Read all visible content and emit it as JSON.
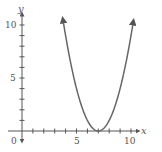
{
  "chart_data": {
    "type": "line",
    "title": "",
    "xlabel": "x",
    "ylabel": "y",
    "function": "y = (x - 7)^2",
    "x": [
      3.76,
      4,
      4.5,
      5,
      5.5,
      6,
      6.5,
      7,
      7.5,
      8,
      8.5,
      9,
      9.5,
      10,
      10.24
    ],
    "values": [
      10.5,
      9,
      6.25,
      4,
      2.25,
      1,
      0.25,
      0,
      0.25,
      1,
      2.25,
      4,
      6.25,
      9,
      10.5
    ],
    "xlim": [
      0,
      11
    ],
    "ylim": [
      0,
      11
    ],
    "x_ticks": [
      0,
      5,
      10
    ],
    "y_ticks": [
      5,
      10
    ],
    "grid": false,
    "legend": null,
    "arrows_on_curve_ends": true,
    "color": "#666666"
  },
  "labels": {
    "x_axis": "x",
    "y_axis": "y",
    "origin": "0",
    "x5": "5",
    "x10": "10",
    "y5": "5",
    "y10": "10"
  }
}
